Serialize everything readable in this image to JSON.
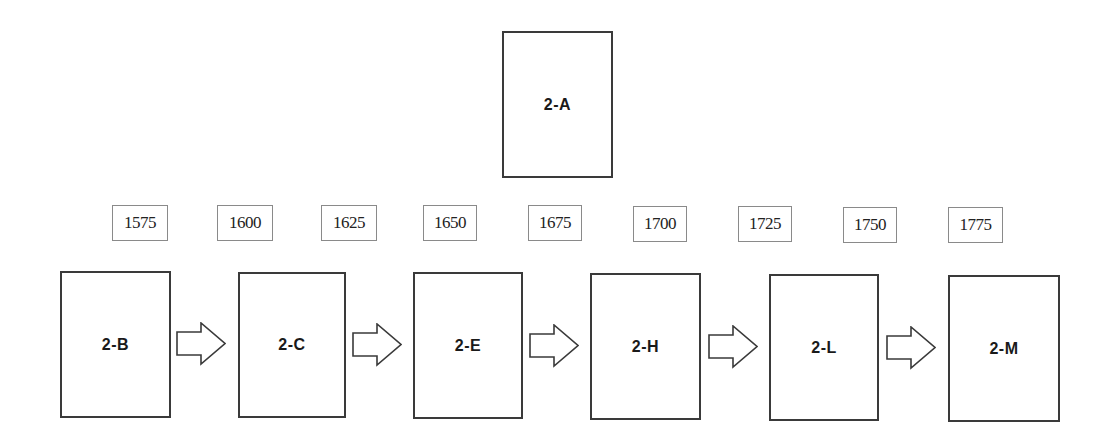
{
  "diagram": {
    "type": "timeline-flow",
    "top_stage": {
      "id": "2-A",
      "label": "2-A"
    },
    "years": [
      {
        "label": "1575"
      },
      {
        "label": "1600"
      },
      {
        "label": "1625"
      },
      {
        "label": "1650"
      },
      {
        "label": "1675"
      },
      {
        "label": "1700"
      },
      {
        "label": "1725"
      },
      {
        "label": "1750"
      },
      {
        "label": "1775"
      }
    ],
    "stages": [
      {
        "id": "2-B",
        "label": "2-B"
      },
      {
        "id": "2-C",
        "label": "2-C"
      },
      {
        "id": "2-E",
        "label": "2-E"
      },
      {
        "id": "2-H",
        "label": "2-H"
      },
      {
        "id": "2-L",
        "label": "2-L"
      },
      {
        "id": "2-M",
        "label": "2-M"
      }
    ],
    "flow": [
      {
        "from": "2-B",
        "to": "2-C",
        "icon": "right-arrow-icon"
      },
      {
        "from": "2-C",
        "to": "2-E",
        "icon": "right-arrow-icon"
      },
      {
        "from": "2-E",
        "to": "2-H",
        "icon": "right-arrow-icon"
      },
      {
        "from": "2-H",
        "to": "2-L",
        "icon": "right-arrow-icon"
      },
      {
        "from": "2-L",
        "to": "2-M",
        "icon": "right-arrow-icon"
      }
    ],
    "colors": {
      "stage_border": "#3a3a3a",
      "year_border": "#8a8a8a",
      "arrow_stroke": "#3a3a3a",
      "background": "#ffffff"
    }
  }
}
